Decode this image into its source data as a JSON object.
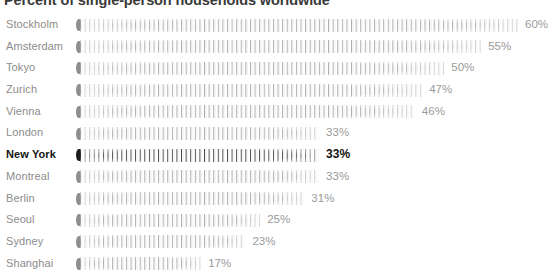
{
  "chart": {
    "title": "Percent of single-person households worldwide",
    "value_suffix": "%"
  },
  "chart_data": {
    "type": "bar",
    "orientation": "horizontal",
    "title": "Percent of single-person households worldwide",
    "xlabel": "",
    "ylabel": "",
    "xlim": [
      0,
      60
    ],
    "grid": false,
    "legend": null,
    "highlight": "New York",
    "categories": [
      "Stockholm",
      "Amsterdam",
      "Tokyo",
      "Zurich",
      "Vienna",
      "London",
      "New York",
      "Montreal",
      "Berlin",
      "Seoul",
      "Sydney",
      "Shanghai"
    ],
    "values": [
      60,
      55,
      50,
      47,
      46,
      33,
      33,
      33,
      31,
      25,
      23,
      17
    ],
    "data_labels": [
      "60%",
      "55%",
      "50%",
      "47%",
      "46%",
      "33%",
      "33%",
      "33%",
      "31%",
      "25%",
      "23%",
      "17%"
    ],
    "colors": {
      "bar": "#aaaaaa",
      "bar_cap": "#8e8e8e",
      "bar_highlight": "#3c3c3c",
      "bar_cap_highlight": "#1c1c1c",
      "label": "#8c8c8c",
      "label_highlight": "#141414",
      "value": "#9a9a9a",
      "value_highlight": "#111111",
      "title": "#3a3a3a",
      "background": "#ffffff"
    }
  }
}
